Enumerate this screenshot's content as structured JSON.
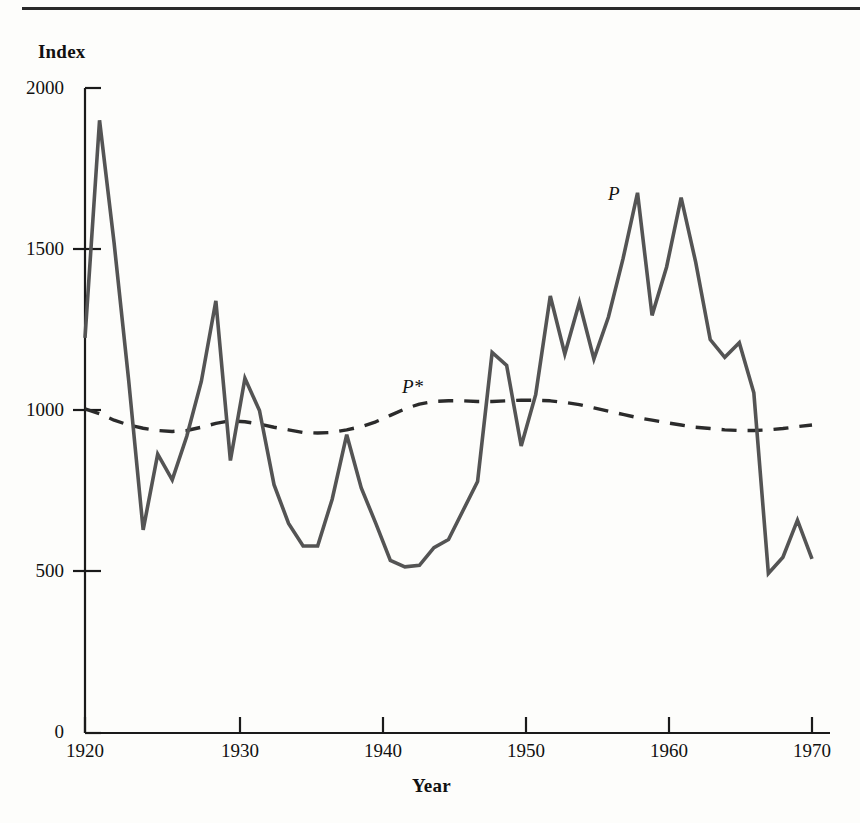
{
  "figure": {
    "y_axis_title": "Index",
    "x_axis_title": "Year",
    "series_label_p": "P",
    "series_label_p_star": "P*",
    "y_ticks": [
      "0",
      "500",
      "1000",
      "1500",
      "2000"
    ],
    "x_ticks": [
      "1920",
      "1930",
      "1940",
      "1950",
      "1960",
      "1970"
    ],
    "line_color": "#4a4a4a",
    "axis_color": "#1a1a1a"
  },
  "chart_data": {
    "type": "line",
    "title": "",
    "subtitle": "",
    "xlabel": "Year",
    "ylabel": "Index",
    "xlim": [
      1920,
      1970
    ],
    "ylim": [
      0,
      2000
    ],
    "xticks": [
      1920,
      1930,
      1940,
      1950,
      1960,
      1970
    ],
    "yticks": [
      0,
      500,
      1000,
      1500,
      2000
    ],
    "grid": false,
    "legend": "inline-annotations",
    "annotations": [
      {
        "text": "P",
        "x": 1956.3,
        "y": 1730,
        "style": "italic"
      },
      {
        "text": "P*",
        "x": 1941.9,
        "y": 1095,
        "style": "italic"
      }
    ],
    "x": [
      1920,
      1921,
      1922,
      1923,
      1924,
      1925,
      1926,
      1927,
      1928,
      1929,
      1930,
      1931,
      1932,
      1933,
      1934,
      1935,
      1936,
      1937,
      1938,
      1939,
      1940,
      1941,
      1942,
      1943,
      1944,
      1945,
      1946,
      1947,
      1948,
      1949,
      1950,
      1951,
      1952,
      1953,
      1954,
      1955,
      1956,
      1957,
      1958,
      1959,
      1960,
      1961,
      1962,
      1963,
      1964,
      1965,
      1966,
      1967,
      1968,
      1969,
      1970
    ],
    "series": [
      {
        "name": "P",
        "style": "solid",
        "values": [
          1225,
          1900,
          1520,
          1095,
          630,
          865,
          785,
          920,
          1090,
          1340,
          845,
          1100,
          1000,
          770,
          650,
          580,
          580,
          725,
          925,
          760,
          650,
          535,
          515,
          520,
          575,
          600,
          690,
          780,
          1180,
          1140,
          890,
          1050,
          1355,
          1175,
          1335,
          1160,
          1290,
          1470,
          1675,
          1295,
          1445,
          1660,
          1460,
          1220,
          1165,
          1210,
          1055,
          495,
          545,
          660,
          540
        ]
      },
      {
        "name": "P*",
        "style": "dashed",
        "values": [
          1005,
          990,
          970,
          955,
          945,
          938,
          935,
          938,
          948,
          960,
          968,
          965,
          958,
          948,
          940,
          932,
          930,
          932,
          940,
          950,
          965,
          985,
          1005,
          1020,
          1028,
          1030,
          1030,
          1028,
          1028,
          1030,
          1032,
          1032,
          1030,
          1025,
          1018,
          1008,
          998,
          988,
          978,
          970,
          962,
          955,
          948,
          944,
          940,
          938,
          938,
          940,
          944,
          950,
          955
        ]
      }
    ]
  }
}
